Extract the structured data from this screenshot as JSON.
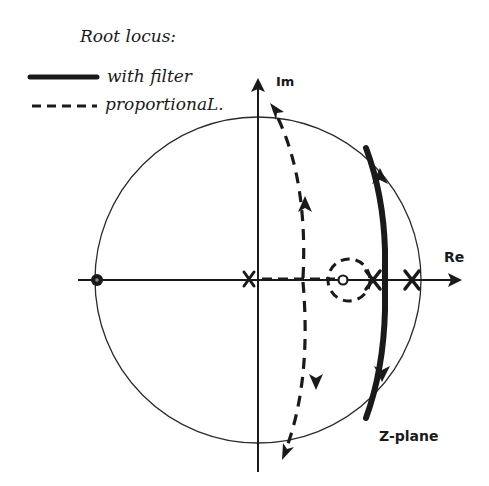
{
  "legend": {
    "title": "Root locus:",
    "items": [
      {
        "style": "solid",
        "label": "with filter"
      },
      {
        "style": "dashed",
        "label": "proportionaL."
      }
    ]
  },
  "axes": {
    "real_label": "Re",
    "imag_label": "Im",
    "plane_label": "Z-plane"
  },
  "diagram": {
    "unit_circle": true,
    "poles": [
      {
        "id": "pole-origin",
        "desc": "pole near origin on real axis"
      },
      {
        "id": "pole-inner",
        "desc": "pole on real axis inside unit circle, near dashed circle"
      },
      {
        "id": "pole-edge",
        "desc": "pole on real axis near unit circle edge"
      }
    ],
    "zeros": [
      {
        "id": "zero-left",
        "desc": "zero at -1 on unit circle (filled dot)"
      },
      {
        "id": "zero-inner",
        "desc": "small open zero on positive real axis inside dashed circle"
      }
    ],
    "loci": [
      {
        "id": "with-filter",
        "style": "solid",
        "desc": "thick near-vertical branch crossing real axis between inner pole and edge pole, arrows pointing away from axis toward unit circle"
      },
      {
        "id": "proportional",
        "style": "dashed",
        "desc": "branch leaving real axis between origin and inner zero, arcing up-left and down-left to outside unit circle; small dashed circle around inner zero"
      }
    ]
  },
  "colors": {
    "ink": "#1a1a1a",
    "background": "#ffffff"
  }
}
